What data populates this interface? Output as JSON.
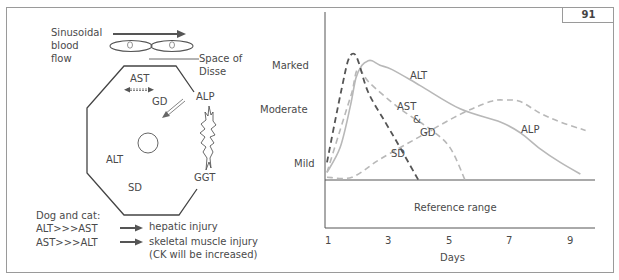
{
  "figure_number": "91",
  "hepatocyte_diagram": {
    "sinusoid_label": [
      "Sinusoidal",
      "blood",
      "flow"
    ],
    "space_of_disse_label": [
      "Space of",
      "Disse"
    ],
    "enzymes": {
      "ast": "AST",
      "gd": "GD",
      "alp": "ALP",
      "alt": "ALT",
      "sd": "SD",
      "ggt": "GGT"
    },
    "icons": [
      "flow-arrow-icon",
      "red-blood-cell-icon",
      "hepatocyte-octagon-icon",
      "nucleus-icon",
      "bidirectional-arrow-icon",
      "diagonal-arrow-icon",
      "lightning-burst-icon"
    ]
  },
  "legend_notes": {
    "heading": "Dog and cat:",
    "rows": [
      {
        "ratio": "ALT>>>AST",
        "meaning": "hepatic injury"
      },
      {
        "ratio": "AST>>>ALT",
        "meaning": "skeletal muscle injury",
        "note": "(CK will be increased)"
      }
    ]
  },
  "chart_data": {
    "type": "line",
    "title": "",
    "xlabel": "Days",
    "ylabel": "",
    "x_ticks": [
      1,
      3,
      5,
      7,
      9
    ],
    "xlim": [
      1,
      9.8
    ],
    "y_levels": [
      {
        "label": "Mild",
        "value": 1
      },
      {
        "label": "Moderate",
        "value": 2
      },
      {
        "label": "Marked",
        "value": 3
      }
    ],
    "ylim": [
      -1.2,
      3.6
    ],
    "reference_band": {
      "label": "Reference range",
      "from": -1.2,
      "to": 0
    },
    "grid": false,
    "series": [
      {
        "name": "ALT",
        "style": "solid",
        "color": "#b8b8b8",
        "points": [
          [
            1.0,
            0.19
          ],
          [
            1.43,
            0.81
          ],
          [
            1.76,
            1.82
          ],
          [
            1.95,
            2.55
          ],
          [
            2.15,
            2.87
          ],
          [
            2.35,
            2.98
          ],
          [
            2.48,
            2.98
          ],
          [
            2.74,
            2.87
          ],
          [
            3.14,
            2.76
          ],
          [
            4.06,
            2.36
          ],
          [
            5.37,
            1.78
          ],
          [
            6.69,
            1.45
          ],
          [
            7.35,
            1.18
          ],
          [
            8.0,
            0.78
          ],
          [
            8.66,
            0.44
          ],
          [
            9.32,
            0.15
          ]
        ]
      },
      {
        "name": "AST & GD",
        "style": "dashed",
        "color": "#b8b8b8",
        "points": [
          [
            1.0,
            0.19
          ],
          [
            1.59,
            1.64
          ],
          [
            1.82,
            2.2
          ],
          [
            2.02,
            2.78
          ],
          [
            2.41,
            2.42
          ],
          [
            3.4,
            1.78
          ],
          [
            4.39,
            1.27
          ],
          [
            5.04,
            0.81
          ],
          [
            5.53,
            0.0
          ]
        ]
      },
      {
        "name": "SD",
        "style": "dashed",
        "color": "#555555",
        "points": [
          [
            1.0,
            0.44
          ],
          [
            1.26,
            1.45
          ],
          [
            1.49,
            2.31
          ],
          [
            1.69,
            2.98
          ],
          [
            1.86,
            3.16
          ],
          [
            2.02,
            2.98
          ],
          [
            2.35,
            2.2
          ],
          [
            2.91,
            1.45
          ],
          [
            3.4,
            0.81
          ],
          [
            4.0,
            0.0
          ]
        ]
      },
      {
        "name": "ALP",
        "style": "dashed",
        "color": "#b8b8b8",
        "points": [
          [
            1.0,
            0.07
          ],
          [
            1.82,
            0.07
          ],
          [
            2.74,
            0.52
          ],
          [
            4.06,
            1.09
          ],
          [
            5.37,
            1.64
          ],
          [
            6.36,
            1.96
          ],
          [
            6.86,
            2.0
          ],
          [
            7.35,
            1.96
          ],
          [
            8.0,
            1.67
          ],
          [
            8.66,
            1.45
          ],
          [
            9.49,
            1.24
          ]
        ]
      }
    ],
    "annotations": [
      {
        "text": "ALT",
        "series": "ALT"
      },
      {
        "text": "AST",
        "series": "AST & GD"
      },
      {
        "text": "&",
        "series": "AST & GD"
      },
      {
        "text": "GD",
        "series": "AST & GD"
      },
      {
        "text": "SD",
        "series": "SD"
      },
      {
        "text": "ALP",
        "series": "ALP"
      }
    ]
  }
}
